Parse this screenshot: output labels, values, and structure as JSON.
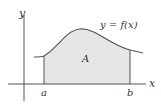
{
  "diagram": {
    "type": "area-under-curve",
    "curve_label": "y = f(x)",
    "region_label": "A",
    "axes": {
      "x_label": "x",
      "y_label": "y"
    },
    "bounds": {
      "lower_label": "a",
      "upper_label": "b"
    },
    "colors": {
      "line": "#555555",
      "fill": "#e6e6e6",
      "text": "#333333"
    }
  }
}
